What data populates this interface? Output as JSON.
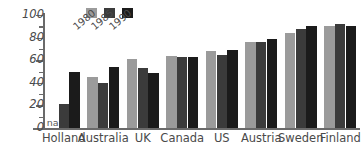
{
  "chart_data": {
    "type": "bar",
    "title": "",
    "subtitle": "",
    "xlabel": "",
    "ylabel": "",
    "ylim": [
      0,
      100
    ],
    "yticks": [
      0,
      20,
      40,
      60,
      80,
      100
    ],
    "ytick_labels": [
      "0",
      "20",
      "40",
      "60",
      "80",
      "100"
    ],
    "minor_tick_step": 10,
    "grid": false,
    "legend_position": "top-left",
    "categories": [
      "Holland",
      "Australia",
      "UK",
      "Canada",
      "US",
      "Austria",
      "Sweden",
      "Finland"
    ],
    "series": [
      {
        "name": "1980",
        "color": "#9b9b9b",
        "values": [
          null,
          45,
          61,
          64,
          68,
          76,
          84,
          90
        ],
        "value_labels": [
          "na",
          "45",
          "61",
          "64",
          "68",
          "76",
          "84",
          "90"
        ]
      },
      {
        "name": "1985",
        "color": "#3b3b3b",
        "values": [
          21,
          40,
          53,
          63,
          65,
          76,
          88,
          92
        ]
      },
      {
        "name": "1990",
        "color": "#1b1b1b",
        "values": [
          50,
          54,
          49,
          63,
          69,
          79,
          90,
          90
        ]
      }
    ],
    "annotations": [
      {
        "text": "na",
        "category": "Holland",
        "series": "1980"
      }
    ]
  },
  "legend": {
    "entries": [
      {
        "label": "1980",
        "color": "#9b9b9b"
      },
      {
        "label": "1985",
        "color": "#3b3b3b"
      },
      {
        "label": "1990",
        "color": "#1b1b1b"
      }
    ]
  },
  "axis": {
    "y_labels": [
      "100",
      "80",
      "60",
      "40",
      "20",
      "0"
    ],
    "x_labels": [
      "Holland",
      "Australia",
      "UK",
      "Canada",
      "US",
      "Austria",
      "Sweden",
      "Finland"
    ]
  },
  "colors": {
    "series_1980": "#9b9b9b",
    "series_1985": "#3b3b3b",
    "series_1990": "#1b1b1b",
    "axis": "#6a6a6a",
    "text": "#4a4a4a",
    "background": "#ffffff"
  }
}
